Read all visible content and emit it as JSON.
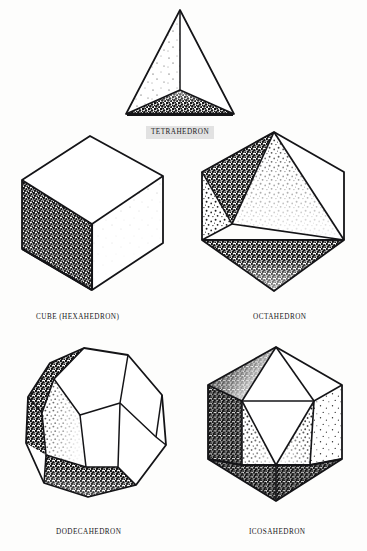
{
  "figure": {
    "background_color": "#fdfdfc",
    "ink_color": "#17171a",
    "label_box_color": "#e2e2e2",
    "style": "scanned halftone line drawing with stippled shading"
  },
  "solids": [
    {
      "id": "tetrahedron",
      "label": "TETRAHEDRON",
      "label_boxed": true,
      "faces": 4,
      "face_shape": "triangle",
      "row": 1,
      "column": 1
    },
    {
      "id": "cube",
      "label": "CUBE (HEXAHEDRON)",
      "label_boxed": false,
      "faces": 6,
      "face_shape": "square",
      "row": 2,
      "column": 1
    },
    {
      "id": "octahedron",
      "label": "OCTAHEDRON",
      "label_boxed": false,
      "faces": 8,
      "face_shape": "triangle",
      "row": 2,
      "column": 2
    },
    {
      "id": "dodecahedron",
      "label": "DODECAHEDRON",
      "label_boxed": false,
      "faces": 12,
      "face_shape": "pentagon",
      "row": 3,
      "column": 1
    },
    {
      "id": "icosahedron",
      "label": "ICOSAHEDRON",
      "label_boxed": false,
      "faces": 20,
      "face_shape": "triangle",
      "row": 3,
      "column": 2
    }
  ]
}
